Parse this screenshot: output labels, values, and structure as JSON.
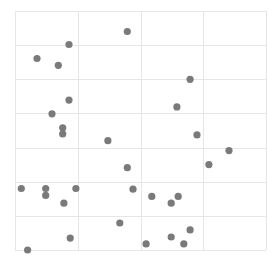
{
  "chart_data": {
    "type": "scatter",
    "title": "",
    "xlabel": "",
    "ylabel": "",
    "xlim": [
      0,
      4
    ],
    "ylim": [
      0,
      7
    ],
    "grid": true,
    "legend": null,
    "x_gridlines": [
      0,
      1,
      2,
      3,
      4
    ],
    "y_gridlines": [
      0,
      1,
      2,
      3,
      4,
      5,
      6,
      7
    ],
    "series": [
      {
        "name": "points",
        "color": "#7a7a7a",
        "points": [
          {
            "x": 1.79,
            "y": 6.4
          },
          {
            "x": 0.86,
            "y": 6.02
          },
          {
            "x": 0.35,
            "y": 5.61
          },
          {
            "x": 0.69,
            "y": 5.41
          },
          {
            "x": 2.79,
            "y": 5.0
          },
          {
            "x": 0.86,
            "y": 4.39
          },
          {
            "x": 2.58,
            "y": 4.19
          },
          {
            "x": 0.59,
            "y": 3.99
          },
          {
            "x": 0.76,
            "y": 3.58
          },
          {
            "x": 0.76,
            "y": 3.4
          },
          {
            "x": 2.9,
            "y": 3.37
          },
          {
            "x": 1.48,
            "y": 3.2
          },
          {
            "x": 3.41,
            "y": 2.91
          },
          {
            "x": 1.79,
            "y": 2.41
          },
          {
            "x": 3.09,
            "y": 2.5
          },
          {
            "x": 0.1,
            "y": 1.8
          },
          {
            "x": 0.49,
            "y": 1.8
          },
          {
            "x": 0.97,
            "y": 1.8
          },
          {
            "x": 1.88,
            "y": 1.78
          },
          {
            "x": 0.49,
            "y": 1.6
          },
          {
            "x": 2.18,
            "y": 1.57
          },
          {
            "x": 2.6,
            "y": 1.57
          },
          {
            "x": 0.78,
            "y": 1.37
          },
          {
            "x": 2.49,
            "y": 1.37
          },
          {
            "x": 1.67,
            "y": 0.79
          },
          {
            "x": 2.79,
            "y": 0.59
          },
          {
            "x": 0.88,
            "y": 0.35
          },
          {
            "x": 2.49,
            "y": 0.38
          },
          {
            "x": 2.09,
            "y": 0.18
          },
          {
            "x": 2.69,
            "y": 0.18
          },
          {
            "x": 0.2,
            "y": 0.0
          }
        ]
      }
    ]
  },
  "plot": {
    "left": 15,
    "top": 11,
    "right": 266,
    "bottom": 250,
    "grid_color": "#e6e6e6",
    "border_color": "#ebebeb",
    "point_radius": 3.6
  }
}
